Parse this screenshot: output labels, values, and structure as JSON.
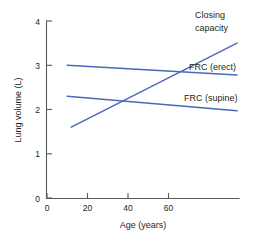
{
  "chart_data": {
    "type": "line",
    "title": "",
    "xlabel": "Age (years)",
    "ylabel": "Lung volume (L)",
    "xlim": [
      0,
      94
    ],
    "ylim": [
      0,
      4
    ],
    "grid": false,
    "legend_position": "inline-right",
    "x_ticks": [
      "0",
      "20",
      "40",
      "60"
    ],
    "x_tick_values": [
      0,
      20,
      40,
      60
    ],
    "y_ticks": [
      "0",
      "1",
      "2",
      "3",
      "4"
    ],
    "y_tick_values": [
      0,
      1,
      2,
      3,
      4
    ],
    "line_color": "#4A69B8",
    "axis_color": "#58595B",
    "text_color": "#231F20",
    "series": [
      {
        "name": "Closing capacity",
        "label_lines": [
          "Closing",
          "capacity"
        ],
        "x": [
          12,
          94
        ],
        "values": [
          1.6,
          3.5
        ],
        "color": "#4A69B8"
      },
      {
        "name": "FRC (erect)",
        "label_lines": [
          "FRC (erect)"
        ],
        "x": [
          10,
          94
        ],
        "values": [
          3.0,
          2.78
        ],
        "color": "#4A69B8"
      },
      {
        "name": "FRC (supine)",
        "label_lines": [
          "FRC (supine)"
        ],
        "x": [
          10,
          94
        ],
        "values": [
          2.3,
          1.97
        ],
        "color": "#4A69B8"
      }
    ],
    "annotations": [
      {
        "text": "Closing",
        "x": 99,
        "y": 3.73
      },
      {
        "text": "capacity",
        "x": 99,
        "y": 3.43
      },
      {
        "text": "FRC (erect)",
        "x": 93,
        "y": 2.72
      },
      {
        "text": "FRC (supine)",
        "x": 90,
        "y": 2.01
      }
    ],
    "intersections": [
      {
        "series": [
          "Closing capacity",
          "FRC (supine)"
        ],
        "x": 36,
        "y": 2.12
      },
      {
        "series": [
          "Closing capacity",
          "FRC (erect)"
        ],
        "x": 60,
        "y": 2.85
      }
    ]
  }
}
